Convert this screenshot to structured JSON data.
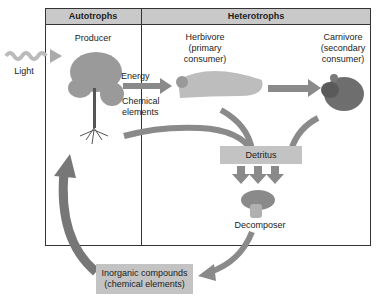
{
  "diagram": {
    "columns": [
      {
        "header": "Autotrophs"
      },
      {
        "header": "Heterotrophs"
      }
    ],
    "nodes": {
      "light": "Light",
      "producer": "Producer",
      "herbivore_line1": "Herbivore",
      "herbivore_line2": "(primary",
      "herbivore_line3": "consumer)",
      "carnivore_line1": "Carnivore",
      "carnivore_line2": "(secondary",
      "carnivore_line3": "consumer)",
      "detritus": "Detritus",
      "decomposer": "Decomposer",
      "inorganic_line1": "Inorganic compounds",
      "inorganic_line2": "(chemical elements)"
    },
    "arrow_labels": {
      "energy": "Energy",
      "chemical_line1": "Chemical",
      "chemical_line2": "elements"
    },
    "colors": {
      "arrow": "#8a8a8a",
      "box": "#c3c3c3",
      "header": "#c9c9c9",
      "border": "#333333"
    }
  }
}
